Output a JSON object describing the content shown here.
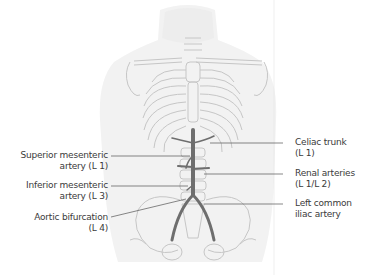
{
  "figure": {
    "labels_left": [
      {
        "id": "superior-mesenteric",
        "text": "Superior mesenteric\nartery (L 1)"
      },
      {
        "id": "inferior-mesenteric",
        "text": "Inferior mesenteric\nartery (L 3)"
      },
      {
        "id": "aortic-bifurcation",
        "text": "Aortic bifurcation\n(L 4)"
      }
    ],
    "labels_right": [
      {
        "id": "celiac-trunk",
        "text": "Celiac trunk\n(L 1)"
      },
      {
        "id": "renal-arteries",
        "text": "Renal arteries\n(L 1/L 2)"
      },
      {
        "id": "left-common-iliac",
        "text": "Left common\niliac artery"
      }
    ],
    "colors": {
      "text": "#3a3a3a",
      "leader_line": "#555555",
      "bone_outline": "#c8c8c8",
      "artery": "#6e6e6e",
      "body_shade": "#eeeeee"
    }
  }
}
